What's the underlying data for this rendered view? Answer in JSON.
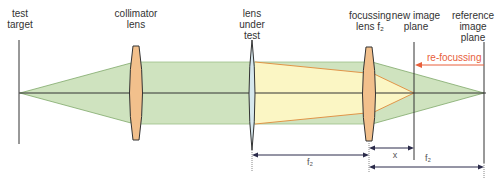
{
  "labels": {
    "test_target": "test\ntarget",
    "collimator_lens": "collimator\nlens",
    "lens_under_test": "lens\nunder\ntest",
    "focussing_lens": "focussing\nlens f₂",
    "new_image_plane": "new image\nplane",
    "reference_image_plane": "reference\nimage\nplane",
    "refocussing": "re-focussing"
  },
  "dimensions": {
    "f2_left": "f₂",
    "x": "x",
    "f2_right": "f₂"
  },
  "colors": {
    "beam_green": "#cfe3bf",
    "beam_green_edge": "#7fa86a",
    "beam_yellow": "#fbf6c4",
    "beam_yellow_edge": "#e08a3a",
    "lens_orange": "#f2c08c",
    "lens_blue": "#d6e8ee",
    "refocus_red": "#e8603c",
    "line_dark": "#333333",
    "dim_arrow": "#2b2b4a"
  }
}
